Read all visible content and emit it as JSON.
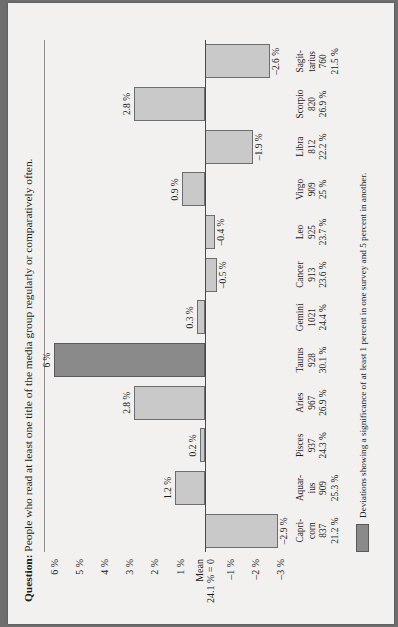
{
  "title": {
    "prefix": "Question:",
    "text": " People who read at least one title of the media group regularly or comparatively often."
  },
  "legend": {
    "text": "Deviations showing a significance of at least 1 percent in one survey and 5 percent in another.",
    "swatch_color": "#8a8a8a"
  },
  "axis": {
    "mean_line1": "Mean",
    "mean_line2": "24.1 % = 0",
    "ticks": [
      "6 %",
      "5 %",
      "4 %",
      "3 %",
      "2 %",
      "1 %",
      "",
      "–1 %",
      "–2 %",
      "–3 %"
    ]
  },
  "colors": {
    "bar_fill": "#c9c9c9",
    "bar_stroke": "#6d6d6d",
    "bar_significant": "#8a8a8a",
    "paper": "#f2f1ef",
    "frame": "#6e6e6e"
  },
  "chart_data": {
    "type": "bar",
    "title": "Question: People who read at least one title of the media group regularly or comparatively often.",
    "xlabel": "",
    "ylabel": "",
    "ylim": [
      -3.5,
      6.5
    ],
    "grid": true,
    "legend_position": "bottom-left",
    "categories": [
      "Capri-\ncorn",
      "Aquar-\nius",
      "Pisces",
      "Aries",
      "Taurus",
      "Gemini",
      "Cancer",
      "Leo",
      "Virgo",
      "Libra",
      "Scorpio",
      "Sagit-\ntarius"
    ],
    "values": [
      -2.9,
      1.2,
      0.2,
      2.8,
      6.0,
      0.3,
      -0.5,
      -0.4,
      0.9,
      -1.9,
      2.8,
      -2.6
    ],
    "data_labels": [
      "–2.9 %",
      "1.2 %",
      "0.2 %",
      "2.8 %",
      "6 %",
      "0.3 %",
      "–0.5 %",
      "–0.4 %",
      "0.9 %",
      "–1.9 %",
      "2.8 %",
      "–2.6 %"
    ],
    "significant": [
      false,
      false,
      false,
      false,
      true,
      false,
      false,
      false,
      false,
      false,
      false,
      false
    ],
    "counts": [
      837,
      909,
      937,
      967,
      928,
      1021,
      913,
      925,
      909,
      812,
      820,
      760
    ],
    "percentages": [
      "21.2 %",
      "25.3 %",
      "24.3 %",
      "26.9 %",
      "30.1 %",
      "24.4 %",
      "23.6 %",
      "23.7 %",
      "25 %",
      "22.2 %",
      "26.9 %",
      "21.5 %"
    ],
    "ytick_labels": [
      "6 %",
      "5 %",
      "4 %",
      "3 %",
      "2 %",
      "1 %",
      "Mean 24.1 % = 0",
      "–1 %",
      "–2 %",
      "–3 %"
    ],
    "ytick_values": [
      6,
      5,
      4,
      3,
      2,
      1,
      0,
      -1,
      -2,
      -3
    ]
  }
}
